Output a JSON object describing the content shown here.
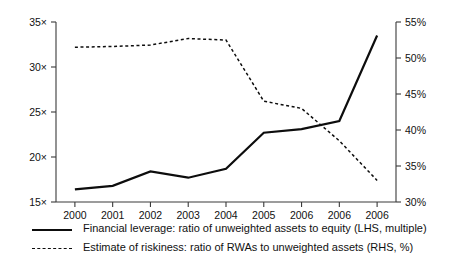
{
  "chart_data": {
    "type": "line",
    "title": "",
    "subtitle": "",
    "xlabel": "",
    "ylabel": "",
    "grid": false,
    "legend_position": "bottom-left",
    "categories": [
      "2000",
      "2001",
      "2002",
      "2003",
      "2004",
      "2005",
      "2006",
      "2006",
      "2006"
    ],
    "axes": {
      "left": {
        "label": "",
        "unit": "×",
        "ylim": [
          15,
          35
        ],
        "ticks": [
          15,
          20,
          25,
          30,
          35
        ],
        "tick_labels": [
          "15×",
          "20×",
          "25×",
          "30×",
          "35×"
        ]
      },
      "right": {
        "label": "",
        "unit": "%",
        "ylim": [
          30,
          55
        ],
        "ticks": [
          30,
          35,
          40,
          45,
          50,
          55
        ],
        "tick_labels": [
          "30%",
          "35%",
          "40%",
          "45%",
          "50%",
          "55%"
        ]
      },
      "x": {
        "tick_labels": [
          "2000",
          "2001",
          "2002",
          "2003",
          "2004",
          "2005",
          "2006",
          "2006",
          "2006"
        ]
      }
    },
    "series": [
      {
        "name": "Financial leverage: ratio of unweighted assets to equity (LHS, multiple)",
        "axis": "left",
        "style": "solid",
        "color": "#0d0d0d",
        "values": [
          16.4,
          16.8,
          18.4,
          17.7,
          18.7,
          22.7,
          23.1,
          24.0,
          33.5
        ]
      },
      {
        "name": "Estimate of riskiness: ratio of RWAs to unweighted assets (RHS, %)",
        "axis": "right",
        "style": "dotted",
        "color": "#0d0d0d",
        "values": [
          51.5,
          51.6,
          51.8,
          52.7,
          52.5,
          44.0,
          43.0,
          38.5,
          33.0
        ]
      }
    ]
  },
  "legend": {
    "items": [
      {
        "label": "Financial leverage: ratio of unweighted assets to equity (LHS, multiple)",
        "style": "solid"
      },
      {
        "label": "Estimate of riskiness: ratio of RWAs to unweighted assets (RHS, %)",
        "style": "dotted"
      }
    ]
  }
}
